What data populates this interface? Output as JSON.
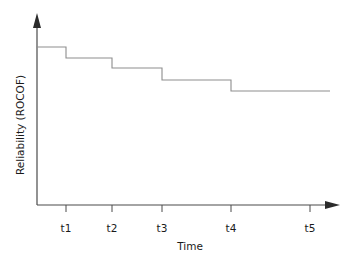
{
  "chart_data": {
    "type": "line",
    "subtype": "step-post",
    "title": "",
    "subtitle": "",
    "xlabel": "Time",
    "ylabel": "Reliability (ROCOF)",
    "categories": [
      "t1",
      "t2",
      "t3",
      "t4",
      "t5"
    ],
    "x_tick_labels": [
      "t1",
      "t2",
      "t3",
      "t4",
      "t5"
    ],
    "x_tick_positions": [
      66,
      112,
      162,
      231,
      310
    ],
    "y_tick_labels": [],
    "grid": false,
    "legend": null,
    "legend_position": "none",
    "axis_style": "arrow-ended",
    "xlim": [
      36,
      330
    ],
    "ylim": [
      205,
      20
    ],
    "series": [
      {
        "name": "Reliability (ROCOF)",
        "step_segments": [
          {
            "label": "before t1",
            "x_start": 36,
            "x_end": 66,
            "y": 47
          },
          {
            "label": "t1 to t2",
            "x_start": 66,
            "x_end": 112,
            "y": 58
          },
          {
            "label": "t2 to t3",
            "x_start": 112,
            "x_end": 162,
            "y": 68
          },
          {
            "label": "t3 to t4",
            "x_start": 162,
            "x_end": 231,
            "y": 80
          },
          {
            "label": "t4 to t5",
            "x_start": 231,
            "x_end": 330,
            "y": 91
          }
        ],
        "values": [
          47,
          58,
          68,
          80,
          91
        ],
        "trend": "monotonically decreasing"
      }
    ],
    "annotations": [],
    "colors": {
      "step_line": "#8d8d8d",
      "axis": "#4a4a4a",
      "arrow": "#2b2b2b",
      "text": "#1a1a1a",
      "background": "#ffffff"
    }
  },
  "axes": {
    "y": {
      "title": "Reliability (ROCOF)",
      "origin_x": 37,
      "top_y": 20,
      "bottom_y": 205
    },
    "x": {
      "title": "Time",
      "left_x": 37,
      "right_x": 335,
      "y": 205
    }
  }
}
